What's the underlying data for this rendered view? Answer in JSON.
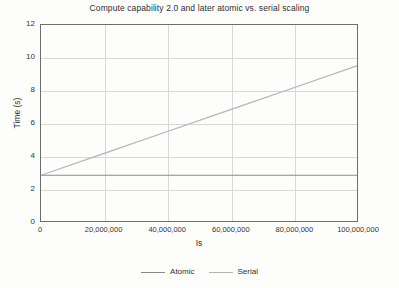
{
  "chart_data": {
    "type": "line",
    "title": "Compute capability 2.0 and later atomic vs. serial scaling",
    "xlabel": "Is",
    "ylabel": "Time (s)",
    "xlim": [
      0,
      100000000
    ],
    "ylim": [
      0,
      12
    ],
    "grid": true,
    "legend_position": "bottom-center",
    "x_ticks": [
      0,
      20000000,
      40000000,
      60000000,
      80000000,
      100000000
    ],
    "x_tick_labels": [
      "0",
      "20,000,000",
      "40,000,000",
      "60,000,000",
      "80,000,000",
      "100,000,000"
    ],
    "y_ticks": [
      0,
      2,
      4,
      6,
      8,
      10,
      12
    ],
    "y_tick_labels": [
      "0",
      "2",
      "4",
      "6",
      "8",
      "10",
      "12"
    ],
    "series": [
      {
        "name": "Atomic",
        "color": "#8a8a8a",
        "x": [
          0,
          20000000,
          40000000,
          60000000,
          80000000,
          100000000
        ],
        "values": [
          2.8,
          2.8,
          2.8,
          2.8,
          2.8,
          2.8
        ]
      },
      {
        "name": "Serial",
        "color": "#b4b4b4",
        "x": [
          0,
          20000000,
          40000000,
          60000000,
          80000000,
          100000000
        ],
        "values": [
          2.8,
          4.14,
          5.48,
          6.82,
          8.16,
          9.5
        ]
      }
    ]
  },
  "legend": {
    "items": [
      {
        "label": "Atomic",
        "color": "#8a8a8a"
      },
      {
        "label": "Serial",
        "color": "#b4b4b4"
      }
    ]
  },
  "colors": {
    "frame": "#6d6d6d",
    "grid": "#d8d8d8",
    "background": "#fdfdfc",
    "text": "#2f2f2f"
  }
}
